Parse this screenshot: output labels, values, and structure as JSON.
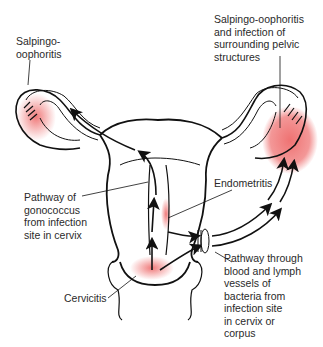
{
  "diagram": {
    "colors": {
      "outline": "#111111",
      "infection": "#ee6b6b",
      "label_text": "#2a2a2a",
      "background": "#ffffff"
    },
    "labels": {
      "salpingo_left": "Salpingo-\noophoritis",
      "salpingo_right": "Salpingo-oophoritis\nand infection of\nsurrounding pelvic\nstructures",
      "pathway_gonococcus": "Pathway of\ngonococcus\nfrom infection\nsite in cervix",
      "endometritis": "Endometritis",
      "pathway_blood_lymph": "Pathway through\nblood and lymph\nvessels of\nbacteria from\ninfection site\nin cervix or\ncorpus",
      "cervicitis": "Cervicitis"
    }
  }
}
